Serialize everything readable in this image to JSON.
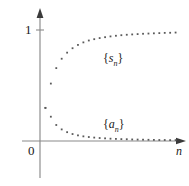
{
  "figure": {
    "name": "sequence-and-partial-sums-plot",
    "background": "#ffffff",
    "ink_color": "#5a5a5a",
    "axis_color": "#8a8a8a"
  },
  "axes": {
    "x_axis_label": "n",
    "y_tick_label": "1",
    "origin_label": "0",
    "x_range_px": [
      40,
      181
    ],
    "y_range_px": [
      141,
      14
    ]
  },
  "labels": {
    "sn": {
      "open": "{",
      "symbol": "s",
      "subscript": "n",
      "close": "}"
    },
    "an": {
      "open": "{",
      "symbol": "a",
      "subscript": "n",
      "close": "}"
    }
  },
  "chart_data": {
    "type": "scatter",
    "title": "",
    "xlabel": "n",
    "ylabel": "",
    "grid": false,
    "legend": "inline-annotations",
    "xlim": [
      0,
      26
    ],
    "ylim": [
      0,
      1.15
    ],
    "yticks": [
      1
    ],
    "ytick_labels": [
      "1"
    ],
    "xticks": [
      0
    ],
    "xtick_labels": [
      "0"
    ],
    "annotations": [
      {
        "text": "{s_n}",
        "x": 11.5,
        "y": 0.76
      },
      {
        "text": "{a_n}",
        "x": 11.5,
        "y": 0.17
      }
    ],
    "series": [
      {
        "name": "{s_n}",
        "label": "partial sums converging to 1",
        "x": [
          1,
          2,
          3,
          4,
          5,
          6,
          7,
          8,
          9,
          10,
          11,
          12,
          13,
          14,
          15,
          16,
          17,
          18,
          19,
          20,
          21,
          22,
          23,
          24,
          25
        ],
        "y": [
          0.3,
          0.52,
          0.66,
          0.745,
          0.8,
          0.84,
          0.87,
          0.893,
          0.91,
          0.922,
          0.932,
          0.94,
          0.947,
          0.953,
          0.958,
          0.962,
          0.965,
          0.968,
          0.971,
          0.973,
          0.975,
          0.977,
          0.979,
          0.98,
          0.982
        ]
      },
      {
        "name": "{a_n}",
        "label": "terms converging to 0",
        "x": [
          1,
          2,
          3,
          4,
          5,
          6,
          7,
          8,
          9,
          10,
          11,
          12,
          13,
          14,
          15,
          16,
          17,
          18,
          19,
          20,
          21,
          22,
          23,
          24,
          25
        ],
        "y": [
          0.3,
          0.22,
          0.145,
          0.105,
          0.08,
          0.063,
          0.051,
          0.042,
          0.036,
          0.031,
          0.027,
          0.024,
          0.021,
          0.019,
          0.017,
          0.016,
          0.014,
          0.013,
          0.012,
          0.011,
          0.01,
          0.009,
          0.009,
          0.008,
          0.008
        ]
      }
    ]
  }
}
